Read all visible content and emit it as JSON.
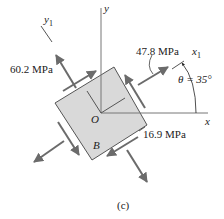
{
  "figure": {
    "caption": "(c)",
    "axes": {
      "x": "x",
      "y": "y",
      "x1": "x",
      "x1_sub": "1",
      "y1": "y",
      "y1_sub": "1"
    },
    "origin": "O",
    "point": "B",
    "angle": "θ = 35°",
    "stresses": {
      "normal_y1": "60.2 MPa",
      "normal_x1": "47.8 MPa",
      "shear": "16.9 MPa"
    },
    "colors": {
      "element_fill": "#d9d9d9",
      "arrow": "#6b6b6b",
      "line": "#555555"
    }
  }
}
